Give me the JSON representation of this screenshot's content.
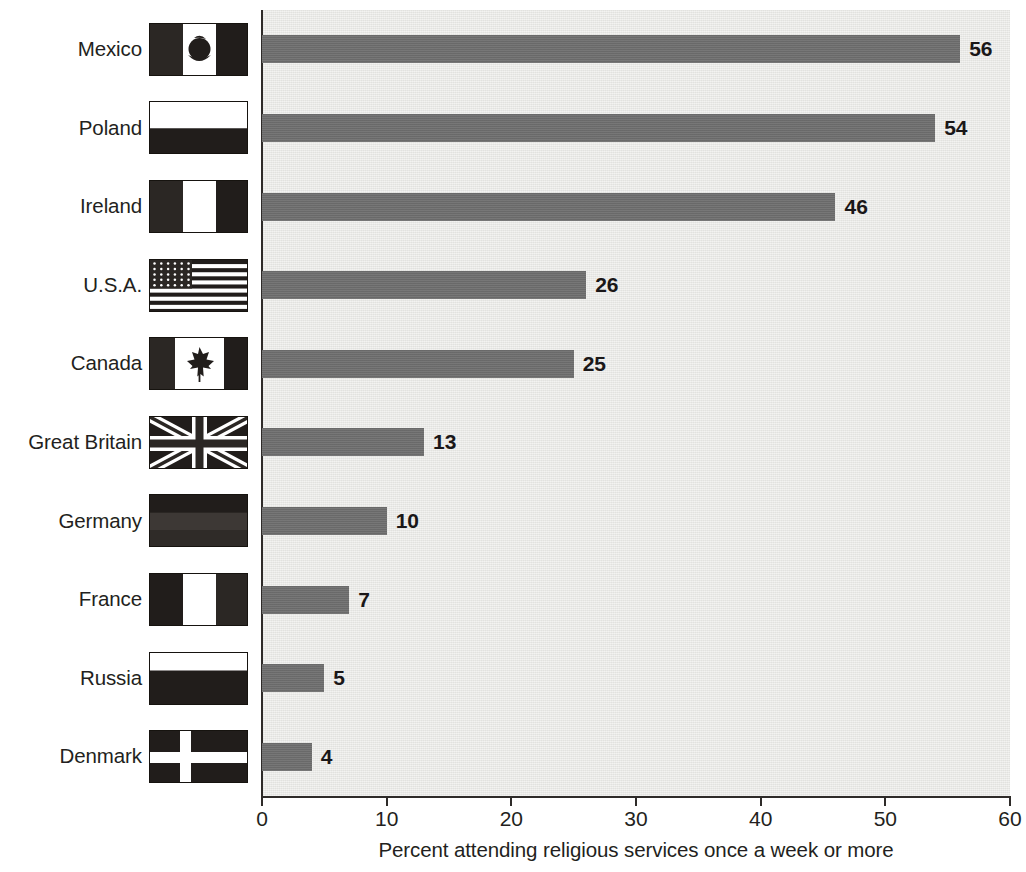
{
  "chart_data": {
    "type": "bar",
    "orientation": "horizontal",
    "title": "",
    "xlabel": "Percent attending religious services once a week or more",
    "ylabel": "",
    "xlim": [
      0,
      60
    ],
    "xticks": [
      0,
      10,
      20,
      30,
      40,
      50,
      60
    ],
    "xtick_labels": [
      "0",
      "10",
      "20",
      "30",
      "40",
      "50",
      "60"
    ],
    "grid": false,
    "legend": false,
    "categories": [
      "Mexico",
      "Poland",
      "Ireland",
      "U.S.A.",
      "Canada",
      "Great Britain",
      "Germany",
      "France",
      "Russia",
      "Denmark"
    ],
    "values": [
      56,
      54,
      46,
      26,
      25,
      13,
      10,
      7,
      5,
      4
    ],
    "data_labels": [
      "56",
      "54",
      "46",
      "26",
      "25",
      "13",
      "10",
      "7",
      "5",
      "4"
    ],
    "bar_color": "#6f6f6f",
    "plot_background_color": "#e9e9e6"
  },
  "rows": [
    {
      "label": "Mexico",
      "value": 56,
      "value_label": "56",
      "flag": "flag-mexico"
    },
    {
      "label": "Poland",
      "value": 54,
      "value_label": "54",
      "flag": "flag-poland"
    },
    {
      "label": "Ireland",
      "value": 46,
      "value_label": "46",
      "flag": "flag-ireland"
    },
    {
      "label": "U.S.A.",
      "value": 26,
      "value_label": "26",
      "flag": "flag-usa"
    },
    {
      "label": "Canada",
      "value": 25,
      "value_label": "25",
      "flag": "flag-canada"
    },
    {
      "label": "Great Britain",
      "value": 13,
      "value_label": "13",
      "flag": "flag-great-britain"
    },
    {
      "label": "Germany",
      "value": 10,
      "value_label": "10",
      "flag": "flag-germany"
    },
    {
      "label": "France",
      "value": 7,
      "value_label": "7",
      "flag": "flag-france"
    },
    {
      "label": "Russia",
      "value": 5,
      "value_label": "5",
      "flag": "flag-russia"
    },
    {
      "label": "Denmark",
      "value": 4,
      "value_label": "4",
      "flag": "flag-denmark"
    }
  ],
  "axis": {
    "x_title": "Percent attending religious services once a week or more",
    "tick_labels": [
      "0",
      "10",
      "20",
      "30",
      "40",
      "50",
      "60"
    ]
  },
  "colors": {
    "bar": "#6f6f6f",
    "plot_background": "#e9e9e6",
    "axis": "#2e2b29",
    "text": "#231f20",
    "flag_dark": "#2b2724",
    "flag_light": "#ffffff"
  }
}
